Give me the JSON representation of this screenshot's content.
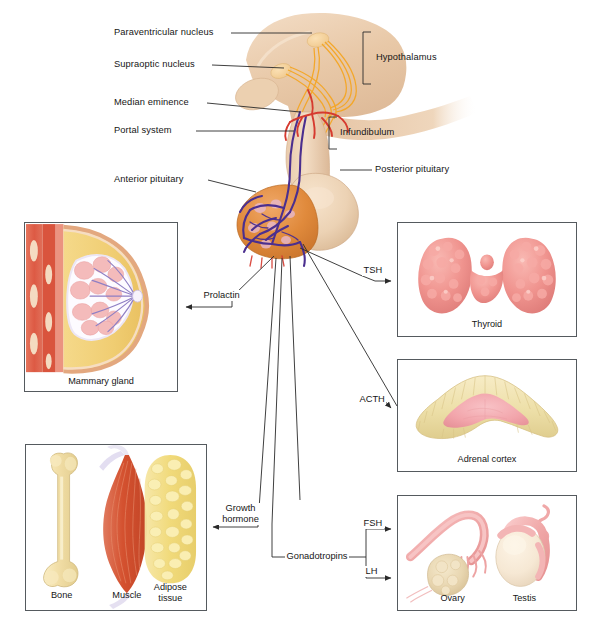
{
  "figure": {
    "background": "#ffffff"
  },
  "anatomy_labels": {
    "paraventricular_nucleus": "Paraventricular nucleus",
    "supraoptic_nucleus": "Supraoptic nucleus",
    "median_eminence": "Median eminence",
    "portal_system": "Portal system",
    "anterior_pituitary": "Anterior pituitary",
    "hypothalamus": "Hypothalamus",
    "infundibulum": "Infundibulum",
    "posterior_pituitary": "Posterior pituitary"
  },
  "hormones": {
    "prolactin": "Prolactin",
    "tsh": "TSH",
    "acth": "ACTH",
    "growth_hormone_line1": "Growth",
    "growth_hormone_line2": "hormone",
    "gonadotropins": "Gonadotropins",
    "fsh": "FSH",
    "lh": "LH"
  },
  "panels": {
    "mammary": {
      "caption": "Mammary gland"
    },
    "thyroid": {
      "caption": "Thyroid"
    },
    "adrenal": {
      "caption": "Adrenal cortex"
    },
    "gonads": {
      "caption_ovary": "Ovary",
      "caption_testis": "Testis"
    },
    "growth_targets": {
      "caption_bone": "Bone",
      "caption_muscle": "Muscle",
      "caption_adipose_line1": "Adipose",
      "caption_adipose_line2": "tissue"
    }
  },
  "colors": {
    "brain_tissue": "#e6c4a4",
    "brain_tissue_light": "#f0d7bd",
    "neural_tract_orange": "#f5a623",
    "anterior_pituitary": "#e08a3c",
    "posterior_pituitary": "#ecd2b4",
    "artery_red": "#d63a2f",
    "portal_vein_purple": "#4b2f8f",
    "thyroid_pink": "#f0948f",
    "adrenal_cream": "#f0dfae",
    "adrenal_pink": "#f2a5ab",
    "bone_cream": "#f2dfae",
    "muscle_red": "#d8503a",
    "adipose_yellow": "#f0d873",
    "gonad_pink": "#f3b3b3",
    "panel_border": "#555a5e",
    "line_black": "#2a2a2a"
  }
}
